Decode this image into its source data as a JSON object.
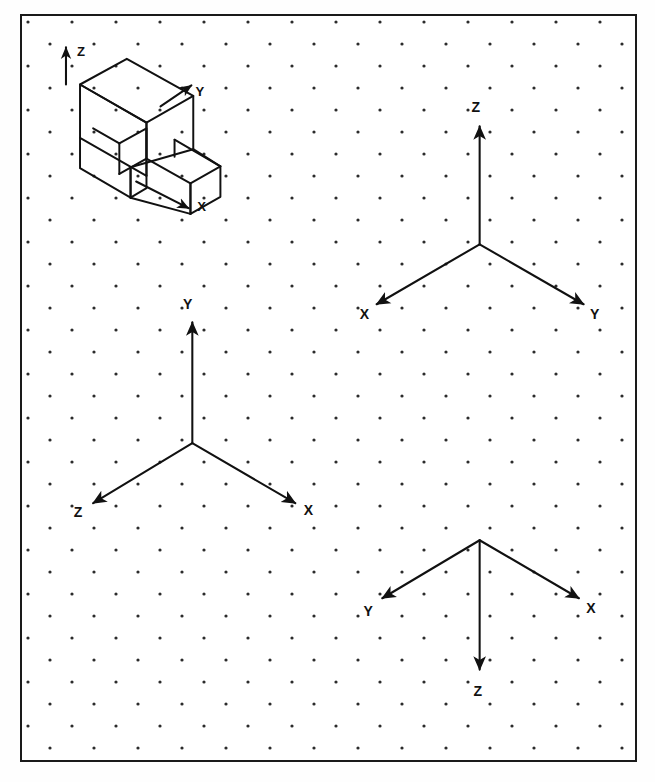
{
  "page": {
    "background_color": "#ffffff",
    "frame_color": "#1a1a1a",
    "ink_color": "#111111",
    "dot_color": "#2b2b2b",
    "width": 655,
    "height": 782
  },
  "grid": {
    "type": "isometric-dot-paper",
    "h_pitch": 44,
    "v_pitch": 22,
    "row_offset": 22,
    "dot_radius": 1.6
  },
  "pictorial": {
    "name": "isometric-block",
    "description": "Isometric pictorial of a C/L shaped block",
    "axes": [
      {
        "label": "Z",
        "direction": "up",
        "label_x": 63,
        "label_y": 42
      },
      {
        "label": "Y",
        "direction": "up-right",
        "label_x": 186,
        "label_y": 84
      },
      {
        "label": "X",
        "direction": "down-right",
        "label_x": 191,
        "label_y": 203
      }
    ]
  },
  "triads": [
    {
      "name": "triad-top-right",
      "origin_x": 489,
      "origin_y": 240,
      "axes": [
        {
          "label": "Z",
          "direction": "up",
          "tip_x": 489,
          "tip_y": 116,
          "label_x": 485,
          "label_y": 101
        },
        {
          "label": "X",
          "direction": "down-left",
          "tip_x": 379,
          "tip_y": 303,
          "label_x": 366,
          "label_y": 318
        },
        {
          "label": "Y",
          "direction": "down-right",
          "tip_x": 600,
          "tip_y": 303,
          "label_x": 607,
          "label_y": 318
        }
      ]
    },
    {
      "name": "triad-bottom-left",
      "origin_x": 182,
      "origin_y": 449,
      "axes": [
        {
          "label": "Y",
          "direction": "up",
          "tip_x": 182,
          "tip_y": 322,
          "label_x": 177,
          "label_y": 308
        },
        {
          "label": "Z",
          "direction": "down-left",
          "tip_x": 76,
          "tip_y": 512,
          "label_x": 60,
          "label_y": 527
        },
        {
          "label": "X",
          "direction": "down-right",
          "tip_x": 292,
          "tip_y": 512,
          "label_x": 301,
          "label_y": 527
        }
      ]
    },
    {
      "name": "triad-bottom-right",
      "origin_x": 489,
      "origin_y": 551,
      "axes": [
        {
          "label": "Z",
          "direction": "down",
          "tip_x": 489,
          "tip_y": 687,
          "label_x": 484,
          "label_y": 712
        },
        {
          "label": "Y",
          "direction": "up-left",
          "tip_x": 385,
          "tip_y": 612,
          "label_x": 370,
          "label_y": 631
        },
        {
          "label": "X",
          "direction": "up-right",
          "tip_x": 595,
          "tip_y": 612,
          "label_x": 604,
          "label_y": 627
        }
      ]
    }
  ]
}
